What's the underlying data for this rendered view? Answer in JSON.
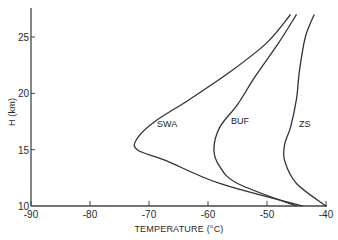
{
  "chart_data": {
    "type": "line",
    "title": "",
    "xlabel": "TEMPERATURE (°C)",
    "ylabel": "H (km)",
    "xlim": [
      -90,
      -40
    ],
    "ylim": [
      10,
      27.5
    ],
    "xticks": [
      "-90",
      "-80",
      "-70",
      "-60",
      "-50",
      "-40"
    ],
    "yticks": [
      "10",
      "15",
      "20",
      "25"
    ],
    "grid": false,
    "legend": "none (inline curve labels)",
    "series": [
      {
        "name": "SWA",
        "points": [
          [
            -44,
            10
          ],
          [
            -58,
            12
          ],
          [
            -67,
            14
          ],
          [
            -72,
            15
          ],
          [
            -72,
            16
          ],
          [
            -69,
            17.5
          ],
          [
            -63,
            19.5
          ],
          [
            -56,
            22
          ],
          [
            -50,
            24.5
          ],
          [
            -46,
            27
          ]
        ]
      },
      {
        "name": "BUF",
        "points": [
          [
            -45,
            10
          ],
          [
            -55,
            12
          ],
          [
            -58,
            13.5
          ],
          [
            -59,
            15
          ],
          [
            -58,
            17
          ],
          [
            -55,
            19
          ],
          [
            -52,
            21.5
          ],
          [
            -48,
            24.5
          ],
          [
            -45,
            27
          ]
        ]
      },
      {
        "name": "ZS",
        "points": [
          [
            -40,
            10
          ],
          [
            -45,
            12
          ],
          [
            -47,
            14
          ],
          [
            -47,
            15.5
          ],
          [
            -46,
            17
          ],
          [
            -45,
            19.5
          ],
          [
            -44.5,
            22
          ],
          [
            -43.5,
            25
          ],
          [
            -42,
            27
          ]
        ]
      }
    ]
  }
}
